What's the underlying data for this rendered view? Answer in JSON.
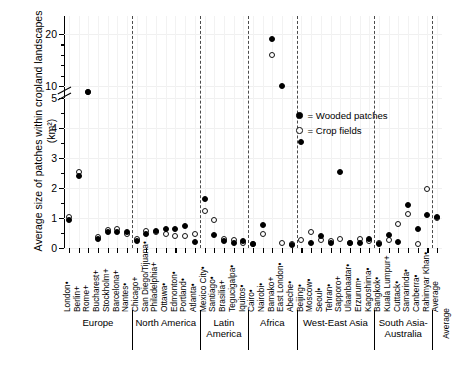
{
  "chart_data": {
    "type": "scatter",
    "title": "",
    "xlabel": "",
    "ylabel": "Average size of patches within cropland landscapes (km²)",
    "ylim": [
      0,
      21
    ],
    "yticks": [
      0,
      1,
      2,
      3,
      4,
      5,
      10,
      20
    ],
    "ytick_labels": [
      "0",
      "1",
      "2",
      "3",
      "4",
      "5",
      "10",
      "20"
    ],
    "axis_break": "between 5 and 10",
    "grid": true,
    "legend_position": "upper right inside",
    "legend": [
      {
        "name": "Wooded patches",
        "marker": "filled-circle",
        "color": "#000000"
      },
      {
        "name": "Crop fields",
        "marker": "open-circle",
        "color": "#ffffff"
      }
    ],
    "categories": [
      "London•",
      "Berlin+",
      "Rome+",
      "Bucharest+",
      "Stockholm+",
      "Barcelona+",
      "Nantes•",
      "Chicago+",
      "San Diego/Tijuana•",
      "Philadelphia+",
      "Ottawa•",
      "Edmonton•",
      "Portland•",
      "Atlanta•",
      "Mexico City•",
      "Santiago•",
      "Brasilia+",
      "Tegucigalpa•",
      "Iquitos•",
      "Cairo•",
      "Nairobi•",
      "Bamako+",
      "East London•",
      "Abeche•",
      "Beijing•",
      "Moscow•",
      "Seoul•",
      "Tehran•",
      "Sapporo+",
      "Ulaanbaatar•",
      "Erzurum•",
      "Kagoshima•",
      "Bangkok•",
      "Kuala Lumpur+",
      "Cuttack•",
      "Samarinda•",
      "Canberra•",
      "Rahimyar Khan•",
      "Average"
    ],
    "series": [
      {
        "name": "Wooded patches",
        "values": [
          0.92,
          2.4,
          8.1,
          0.3,
          0.52,
          0.52,
          0.55,
          0.22,
          0.48,
          0.58,
          0.62,
          0.62,
          0.72,
          0.2,
          1.62,
          0.42,
          0.22,
          0.18,
          0.22,
          0.14,
          0.78,
          19.0,
          10.0,
          0.1,
          3.55,
          0.18,
          0.4,
          0.16,
          2.55,
          0.18,
          0.18,
          0.3,
          0.12,
          0.42,
          0.2,
          1.45,
          0.62,
          1.1,
          1.05
        ]
      },
      {
        "name": "Crop fields",
        "values": [
          1.02,
          2.55,
          8.5,
          0.36,
          0.6,
          0.62,
          0.48,
          0.3,
          0.58,
          0.52,
          0.46,
          0.4,
          0.4,
          0.48,
          1.22,
          0.95,
          0.3,
          0.28,
          0.16,
          0.12,
          0.48,
          16.0,
          0.18,
          0.14,
          0.28,
          0.52,
          0.28,
          0.24,
          0.3,
          0.18,
          0.3,
          0.22,
          0.16,
          0.28,
          0.8,
          1.15,
          0.14,
          1.98,
          1.0
        ]
      }
    ],
    "groups": [
      {
        "label": "Europe",
        "start": 0,
        "end": 6
      },
      {
        "label": "North America",
        "start": 7,
        "end": 13
      },
      {
        "label": "Latin America",
        "start": 14,
        "end": 18
      },
      {
        "label": "Africa",
        "start": 19,
        "end": 23
      },
      {
        "label": "West-East Asia",
        "start": 24,
        "end": 31
      },
      {
        "label": "South Asia-Australia",
        "start": 32,
        "end": 37
      },
      {
        "label": "Average",
        "start": 38,
        "end": 38
      }
    ]
  }
}
